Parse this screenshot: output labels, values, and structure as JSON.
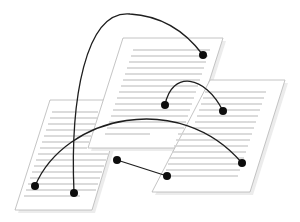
{
  "diagram": {
    "colors": {
      "page_fill": "#ffffff",
      "page_border": "#b5b5b5",
      "text_lines": "#cfcfcf",
      "links": "#1e1e1e",
      "dots": "#0d0d0d"
    },
    "pages": [
      {
        "id": "left-page",
        "points": "50,100 125,100 92,210 15,210",
        "line_count": 14
      },
      {
        "id": "middle-page",
        "points": "123,38 223,38 188,148 88,148",
        "line_count": 16
      },
      {
        "id": "right-page",
        "points": "210,80 285,80 250,192 152,192",
        "line_count": 14
      }
    ],
    "links": [
      {
        "id": "link-1",
        "from": [
          74,
          193
        ],
        "to": [
          203,
          55
        ],
        "path": "M74,193 C70,100 85,10 130,14 C165,16 188,35 203,55"
      },
      {
        "id": "link-2",
        "from": [
          165,
          105
        ],
        "to": [
          223,
          111
        ],
        "path": "M165,105 C172,70 205,75 223,111"
      },
      {
        "id": "link-3",
        "from": [
          35,
          186
        ],
        "to": [
          242,
          163
        ],
        "path": "M35,186 C65,115 180,90 242,163"
      },
      {
        "id": "link-4",
        "from": [
          117,
          160
        ],
        "to": [
          167,
          176
        ],
        "path": "M117,160 L167,176"
      }
    ],
    "dots": [
      [
        203,
        55
      ],
      [
        165,
        105
      ],
      [
        223,
        111
      ],
      [
        242,
        163
      ],
      [
        117,
        160
      ],
      [
        167,
        176
      ],
      [
        35,
        186
      ],
      [
        74,
        193
      ]
    ]
  }
}
